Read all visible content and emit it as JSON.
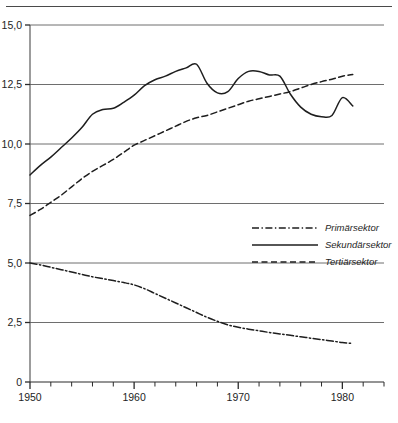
{
  "figure": {
    "background": "#ffffff",
    "ink_color": "#1e1e1e",
    "grid_color": "#6e6e6e",
    "has_top_page_rule": true
  },
  "chart_data": {
    "type": "line",
    "title": "",
    "subtitle": "",
    "xlabel": "",
    "ylabel": "",
    "xlim": [
      1950,
      1984
    ],
    "ylim": [
      0,
      15
    ],
    "grid": true,
    "grid_axis": "y",
    "legend_position": "center-right",
    "x_tick_labels": [
      "1950",
      "1960",
      "1970",
      "1980"
    ],
    "x_tick_label_values": [
      1950,
      1960,
      1970,
      1980
    ],
    "x_minor_tick_step": 1,
    "y_tick_labels": [
      "0",
      "2,5",
      "5,0",
      "7,5",
      "10,0",
      "12,5",
      "15,0"
    ],
    "y_tick_values": [
      0,
      2.5,
      5.0,
      7.5,
      10.0,
      12.5,
      15.0
    ],
    "x": [
      1950,
      1951,
      1952,
      1953,
      1954,
      1955,
      1956,
      1957,
      1958,
      1959,
      1960,
      1961,
      1962,
      1963,
      1964,
      1965,
      1966,
      1967,
      1968,
      1969,
      1970,
      1971,
      1972,
      1973,
      1974,
      1975,
      1976,
      1977,
      1978,
      1979,
      1980,
      1981
    ],
    "series": [
      {
        "name": "Primärsektor",
        "line_style": "dash-dot",
        "color": "#1e1e1e",
        "values": [
          5.0,
          4.92,
          4.82,
          4.72,
          4.62,
          4.52,
          4.42,
          4.34,
          4.26,
          4.18,
          4.08,
          3.92,
          3.72,
          3.52,
          3.32,
          3.12,
          2.92,
          2.72,
          2.55,
          2.4,
          2.3,
          2.22,
          2.15,
          2.08,
          2.02,
          1.96,
          1.9,
          1.84,
          1.78,
          1.72,
          1.66,
          1.62
        ]
      },
      {
        "name": "Sekundärsektor",
        "line_style": "solid",
        "color": "#1e1e1e",
        "values": [
          8.7,
          9.1,
          9.45,
          9.85,
          10.25,
          10.7,
          11.25,
          11.45,
          11.5,
          11.75,
          12.05,
          12.45,
          12.7,
          12.85,
          13.05,
          13.2,
          13.35,
          12.55,
          12.15,
          12.2,
          12.75,
          13.05,
          13.05,
          12.9,
          12.85,
          12.1,
          11.55,
          11.25,
          11.15,
          11.2,
          11.95,
          11.6
        ]
      },
      {
        "name": "Tertiärsektor",
        "line_style": "dashed",
        "color": "#1e1e1e",
        "values": [
          7.0,
          7.25,
          7.55,
          7.85,
          8.2,
          8.55,
          8.85,
          9.1,
          9.35,
          9.65,
          9.95,
          10.15,
          10.35,
          10.55,
          10.75,
          10.95,
          11.1,
          11.2,
          11.35,
          11.5,
          11.65,
          11.8,
          11.9,
          12.0,
          12.1,
          12.2,
          12.35,
          12.5,
          12.62,
          12.72,
          12.85,
          12.92
        ]
      }
    ]
  },
  "legend": {
    "entries": [
      {
        "label": "Primärsektor",
        "style": "dash-dot"
      },
      {
        "label": "Sekundärsektor",
        "style": "solid"
      },
      {
        "label": "Tertiärsektor",
        "style": "dashed"
      }
    ]
  }
}
